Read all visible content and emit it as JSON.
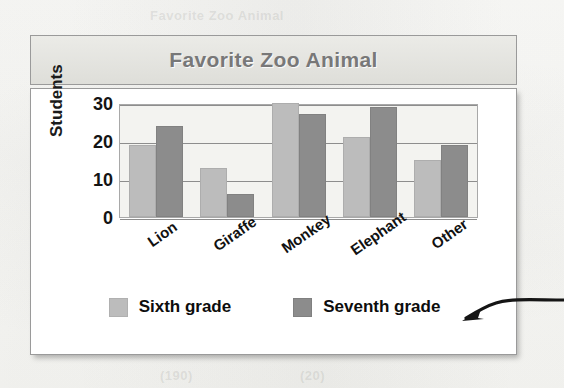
{
  "page": {
    "background_note": "scanned textbook page",
    "ghost_texts": [
      {
        "text": "Favorite Zoo Animal",
        "x": 150,
        "y": 8,
        "size": 13
      },
      {
        "text": "Elephant",
        "x": 210,
        "y": 258,
        "size": 16
      },
      {
        "text": "(190)",
        "x": 160,
        "y": 368,
        "size": 13
      },
      {
        "text": "(20)",
        "x": 300,
        "y": 368,
        "size": 13
      }
    ]
  },
  "chart_data": {
    "type": "bar",
    "title": "Favorite Zoo Animal",
    "xlabel": "",
    "ylabel": "Students",
    "categories": [
      "Lion",
      "Giraffe",
      "Monkey",
      "Elephant",
      "Other"
    ],
    "series": [
      {
        "name": "Sixth grade",
        "color": "#bcbcbc",
        "values": [
          19,
          13,
          30,
          21,
          15
        ]
      },
      {
        "name": "Seventh grade",
        "color": "#8c8c8c",
        "values": [
          24,
          6,
          27,
          29,
          19
        ]
      }
    ],
    "ylim": [
      0,
      30
    ],
    "yticks": [
      30,
      20,
      10,
      0
    ],
    "ytick_labels": [
      "30",
      "20",
      "10",
      "0"
    ],
    "grid": true,
    "grid_axis": "y",
    "legend_position": "bottom",
    "xtick_rotation": -35
  },
  "legend": {
    "items": [
      {
        "label": "Sixth grade",
        "swatch": "six"
      },
      {
        "label": "Seventh grade",
        "swatch": "seven"
      }
    ]
  },
  "annotation": {
    "name": "pointer-arrow",
    "description": "hand-drawn curved arrow pointing left toward the chart",
    "color": "#151515"
  },
  "colors": {
    "series_six": "#bcbcbc",
    "series_seven": "#8c8c8c",
    "title_text": "#787878",
    "banner_bg": "#e6e6e2",
    "plot_bg": "#f3f3f0",
    "gridline": "#8d8d8d",
    "card_border": "#9a9a9a"
  }
}
